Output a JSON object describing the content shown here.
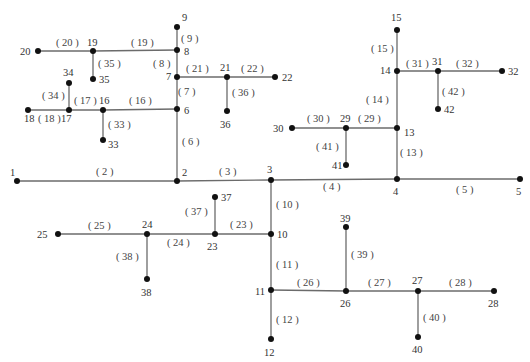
{
  "diagram": {
    "title": "",
    "type": "radial distribution network (42 nodes)",
    "colors": {
      "edge": "#6b6b6b",
      "node": "#111111",
      "text": "#333333"
    },
    "nodes": [
      {
        "id": "1",
        "label": "1"
      },
      {
        "id": "2",
        "label": "2"
      },
      {
        "id": "3",
        "label": "3"
      },
      {
        "id": "4",
        "label": "4"
      },
      {
        "id": "5",
        "label": "5"
      },
      {
        "id": "6",
        "label": "6"
      },
      {
        "id": "7",
        "label": "7"
      },
      {
        "id": "8",
        "label": "8"
      },
      {
        "id": "9",
        "label": "9"
      },
      {
        "id": "10",
        "label": "10"
      },
      {
        "id": "11",
        "label": "11"
      },
      {
        "id": "12",
        "label": "12"
      },
      {
        "id": "13",
        "label": "13"
      },
      {
        "id": "14",
        "label": "14"
      },
      {
        "id": "15",
        "label": "15"
      },
      {
        "id": "16",
        "label": "16"
      },
      {
        "id": "17",
        "label": "17"
      },
      {
        "id": "18",
        "label": "18"
      },
      {
        "id": "19",
        "label": "19"
      },
      {
        "id": "20",
        "label": "20"
      },
      {
        "id": "21",
        "label": "21"
      },
      {
        "id": "22",
        "label": "22"
      },
      {
        "id": "23",
        "label": "23"
      },
      {
        "id": "24",
        "label": "24"
      },
      {
        "id": "25",
        "label": "25"
      },
      {
        "id": "26",
        "label": "26"
      },
      {
        "id": "27",
        "label": "27"
      },
      {
        "id": "28",
        "label": "28"
      },
      {
        "id": "29",
        "label": "29"
      },
      {
        "id": "30",
        "label": "30"
      },
      {
        "id": "31",
        "label": "31"
      },
      {
        "id": "32",
        "label": "32"
      },
      {
        "id": "33",
        "label": "33"
      },
      {
        "id": "34",
        "label": "34"
      },
      {
        "id": "35",
        "label": "35"
      },
      {
        "id": "36",
        "label": "36"
      },
      {
        "id": "37",
        "label": "37"
      },
      {
        "id": "38",
        "label": "38"
      },
      {
        "id": "39",
        "label": "39"
      },
      {
        "id": "40",
        "label": "40"
      },
      {
        "id": "41",
        "label": "41"
      },
      {
        "id": "42",
        "label": "42"
      }
    ],
    "edges": [
      {
        "id": "2",
        "label": "( 2 )",
        "from": "1",
        "to": "2"
      },
      {
        "id": "3",
        "label": "( 3 )",
        "from": "2",
        "to": "3"
      },
      {
        "id": "4",
        "label": "( 4 )",
        "from": "3",
        "to": "4"
      },
      {
        "id": "5",
        "label": "( 5 )",
        "from": "4",
        "to": "5"
      },
      {
        "id": "6",
        "label": "( 6 )",
        "from": "2",
        "to": "6"
      },
      {
        "id": "7",
        "label": "( 7 )",
        "from": "6",
        "to": "7"
      },
      {
        "id": "8",
        "label": "( 8 )",
        "from": "7",
        "to": "8"
      },
      {
        "id": "9",
        "label": "( 9 )",
        "from": "8",
        "to": "9"
      },
      {
        "id": "10",
        "label": "( 10 )",
        "from": "3",
        "to": "10"
      },
      {
        "id": "11",
        "label": "( 11 )",
        "from": "10",
        "to": "11"
      },
      {
        "id": "12",
        "label": "( 12 )",
        "from": "11",
        "to": "12"
      },
      {
        "id": "13",
        "label": "( 13 )",
        "from": "4",
        "to": "13"
      },
      {
        "id": "14",
        "label": "( 14 )",
        "from": "13",
        "to": "14"
      },
      {
        "id": "15",
        "label": "( 15 )",
        "from": "14",
        "to": "15"
      },
      {
        "id": "16",
        "label": "( 16 )",
        "from": "6",
        "to": "16"
      },
      {
        "id": "17",
        "label": "( 17 )",
        "from": "16",
        "to": "17"
      },
      {
        "id": "18",
        "label": "( 18 )",
        "from": "17",
        "to": "18"
      },
      {
        "id": "19",
        "label": "( 19 )",
        "from": "8",
        "to": "19"
      },
      {
        "id": "20",
        "label": "( 20 )",
        "from": "19",
        "to": "20"
      },
      {
        "id": "21",
        "label": "( 21 )",
        "from": "7",
        "to": "21"
      },
      {
        "id": "22",
        "label": "( 22 )",
        "from": "21",
        "to": "22"
      },
      {
        "id": "23",
        "label": "( 23 )",
        "from": "10",
        "to": "23"
      },
      {
        "id": "24",
        "label": "( 24 )",
        "from": "23",
        "to": "24"
      },
      {
        "id": "25",
        "label": "( 25 )",
        "from": "24",
        "to": "25"
      },
      {
        "id": "26",
        "label": "( 26 )",
        "from": "11",
        "to": "26"
      },
      {
        "id": "27",
        "label": "( 27 )",
        "from": "26",
        "to": "27"
      },
      {
        "id": "28",
        "label": "( 28 )",
        "from": "27",
        "to": "28"
      },
      {
        "id": "29",
        "label": "( 29 )",
        "from": "13",
        "to": "29"
      },
      {
        "id": "30",
        "label": "( 30 )",
        "from": "29",
        "to": "30"
      },
      {
        "id": "31",
        "label": "( 31 )",
        "from": "14",
        "to": "31"
      },
      {
        "id": "32",
        "label": "( 32 )",
        "from": "31",
        "to": "32"
      },
      {
        "id": "33",
        "label": "( 33 )",
        "from": "16",
        "to": "33"
      },
      {
        "id": "34",
        "label": "( 34 )",
        "from": "17",
        "to": "34"
      },
      {
        "id": "35",
        "label": "( 35 )",
        "from": "19",
        "to": "35"
      },
      {
        "id": "36",
        "label": "( 36 )",
        "from": "21",
        "to": "36"
      },
      {
        "id": "37",
        "label": "( 37 )",
        "from": "23",
        "to": "37"
      },
      {
        "id": "38",
        "label": "( 38 )",
        "from": "24",
        "to": "38"
      },
      {
        "id": "39",
        "label": "( 39 )",
        "from": "26",
        "to": "39"
      },
      {
        "id": "40",
        "label": "( 40 )",
        "from": "27",
        "to": "40"
      },
      {
        "id": "41",
        "label": "( 41 )",
        "from": "29",
        "to": "41"
      },
      {
        "id": "42",
        "label": "( 42 )",
        "from": "31",
        "to": "42"
      }
    ]
  }
}
